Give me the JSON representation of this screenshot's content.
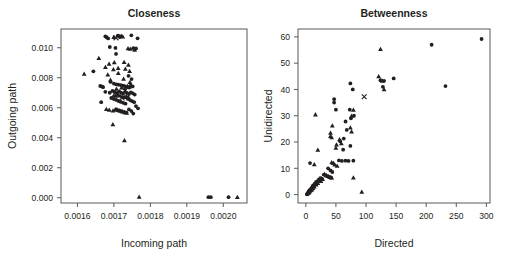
{
  "figure": {
    "background": "#ffffff",
    "ink_color": "#231f20",
    "axis_color": "#58595b"
  },
  "chart_data": [
    {
      "type": "scatter",
      "panel_id": "closeness",
      "title": "Closeness",
      "xlabel": "Incoming path",
      "ylabel": "Outgoing path",
      "xlim": [
        0.001555,
        0.002065
      ],
      "ylim": [
        -0.00035,
        0.01125
      ],
      "xticks": [
        0.0016,
        0.0017,
        0.0018,
        0.0019,
        0.002
      ],
      "xticklabels": [
        "0.0016",
        "0.0017",
        "0.0018",
        "0.0019",
        "0.0020"
      ],
      "yticks": [
        0,
        0.002,
        0.004,
        0.006,
        0.008,
        0.01
      ],
      "yticklabels": [
        "0.000",
        "0.002",
        "0.004",
        "0.006",
        "0.008",
        "0.010"
      ],
      "grid": false,
      "legend": "none",
      "series": [
        {
          "name": "circle-markers",
          "marker": "circle",
          "points": [
            [
              0.0016766,
              0.01076
            ],
            [
              0.0016799,
              0.0107
            ],
            [
              0.0016842,
              0.01062
            ],
            [
              0.0017107,
              0.0108
            ],
            [
              0.0017155,
              0.01077
            ],
            [
              0.0017162,
              0.01071
            ],
            [
              0.0017479,
              0.01083
            ],
            [
              0.0017649,
              0.01063
            ],
            [
              0.0016888,
              0.01005
            ],
            [
              0.0017043,
              0.00999
            ],
            [
              0.0017059,
              0.00959
            ],
            [
              0.0017531,
              0.00997
            ],
            [
              0.0017606,
              0.00995
            ],
            [
              0.0016438,
              0.00843
            ],
            [
              0.0017402,
              0.00813
            ],
            [
              0.0017485,
              0.00791
            ],
            [
              0.0016627,
              0.00745
            ],
            [
              0.0016677,
              0.00741
            ],
            [
              0.0016704,
              0.00737
            ],
            [
              0.0016909,
              0.00772
            ],
            [
              0.0017,
              0.00761
            ],
            [
              0.0017059,
              0.00756
            ],
            [
              0.0017121,
              0.00754
            ],
            [
              0.0017189,
              0.00751
            ],
            [
              0.0017243,
              0.00748
            ],
            [
              0.0017298,
              0.00744
            ],
            [
              0.0017352,
              0.00739
            ],
            [
              0.0017413,
              0.00735
            ],
            [
              0.0017462,
              0.00748
            ],
            [
              0.0017514,
              0.00742
            ],
            [
              0.0016765,
              0.00706
            ],
            [
              0.0016887,
              0.007
            ],
            [
              0.0016962,
              0.00712
            ],
            [
              0.0017022,
              0.00705
            ],
            [
              0.0017081,
              0.00697
            ],
            [
              0.0017143,
              0.00709
            ],
            [
              0.0017196,
              0.00701
            ],
            [
              0.0017251,
              0.00694
            ],
            [
              0.0017306,
              0.00707
            ],
            [
              0.0017358,
              0.00699
            ],
            [
              0.0017412,
              0.00691
            ],
            [
              0.0017466,
              0.00703
            ],
            [
              0.0017519,
              0.00696
            ],
            [
              0.0017571,
              0.00688
            ],
            [
              0.0016652,
              0.00637
            ],
            [
              0.0016928,
              0.00665
            ],
            [
              0.0017,
              0.00658
            ],
            [
              0.0017065,
              0.00652
            ],
            [
              0.0017128,
              0.00645
            ],
            [
              0.0017193,
              0.00639
            ],
            [
              0.0017256,
              0.00633
            ],
            [
              0.0017319,
              0.00627
            ],
            [
              0.0017383,
              0.00659
            ],
            [
              0.0017444,
              0.00651
            ],
            [
              0.0017501,
              0.00644
            ],
            [
              0.0017556,
              0.00637
            ],
            [
              0.0017604,
              0.00611
            ],
            [
              0.0017661,
              0.00596
            ],
            [
              0.0017076,
              0.00589
            ],
            [
              0.0017148,
              0.00582
            ],
            [
              0.0017211,
              0.00577
            ],
            [
              0.0017281,
              0.00572
            ],
            [
              0.0017346,
              0.00568
            ],
            [
              0.0017412,
              0.00589
            ],
            [
              0.0017481,
              0.00578
            ],
            [
              0.0017532,
              0.00561
            ],
            [
              0.0019592,
              4e-05
            ],
            [
              0.0019658,
              4e-05
            ],
            [
              0.0020144,
              4e-05
            ]
          ]
        },
        {
          "name": "triangle-markers",
          "marker": "triangle",
          "points": [
            [
              0.0016996,
              0.01072
            ],
            [
              0.0017213,
              0.01078
            ],
            [
              0.0017243,
              0.01074
            ],
            [
              0.0017387,
              0.00997
            ],
            [
              0.0017449,
              0.00993
            ],
            [
              0.0017568,
              0.00986
            ],
            [
              0.0016587,
              0.00932
            ],
            [
              0.0016868,
              0.00893
            ],
            [
              0.0017011,
              0.00903
            ],
            [
              0.0017281,
              0.00905
            ],
            [
              0.0017398,
              0.00887
            ],
            [
              0.0016768,
              0.00871
            ],
            [
              0.0016987,
              0.00857
            ],
            [
              0.0017117,
              0.00864
            ],
            [
              0.0017314,
              0.00859
            ],
            [
              0.0017431,
              0.00845
            ],
            [
              0.0016185,
              0.00826
            ],
            [
              0.0016833,
              0.00822
            ],
            [
              0.0017121,
              0.00832
            ],
            [
              0.0016906,
              0.00786
            ],
            [
              0.0017266,
              0.00793
            ],
            [
              0.0017441,
              0.00771
            ],
            [
              0.0017069,
              0.00727
            ],
            [
              0.0017211,
              0.00735
            ],
            [
              0.0017303,
              0.00731
            ],
            [
              0.0017376,
              0.00745
            ],
            [
              0.0017425,
              0.0074
            ],
            [
              0.0016998,
              0.00683
            ],
            [
              0.0017055,
              0.00679
            ],
            [
              0.0017113,
              0.00686
            ],
            [
              0.0017167,
              0.00681
            ],
            [
              0.0017225,
              0.00675
            ],
            [
              0.0017281,
              0.00671
            ],
            [
              0.0017339,
              0.00678
            ],
            [
              0.0017395,
              0.00673
            ],
            [
              0.0016794,
              0.00592
            ],
            [
              0.0016873,
              0.00586
            ],
            [
              0.0016976,
              0.00582
            ],
            [
              0.0017037,
              0.00589
            ],
            [
              0.0017101,
              0.00584
            ],
            [
              0.0017162,
              0.00579
            ],
            [
              0.0017224,
              0.00575
            ],
            [
              0.0017289,
              0.0057
            ],
            [
              0.0017351,
              0.00566
            ],
            [
              0.0016972,
              0.00489
            ],
            [
              0.0017289,
              0.00383
            ],
            [
              0.0017693,
              6e-05
            ],
            [
              0.0020385,
              4e-05
            ]
          ]
        },
        {
          "name": "cross-markers",
          "marker": "cross",
          "points": [
            [
              0.0017059,
              0.01066
            ],
            [
              0.0017228,
              0.00665
            ]
          ]
        }
      ]
    },
    {
      "type": "scatter",
      "panel_id": "betweenness",
      "title": "Betweenness",
      "xlabel": "Directed",
      "ylabel": "Unidirected",
      "xlim": [
        -13,
        306
      ],
      "ylim": [
        -3.2,
        63
      ],
      "xticks": [
        0,
        50,
        100,
        150,
        200,
        250,
        300
      ],
      "xticklabels": [
        "0",
        "50",
        "100",
        "150",
        "200",
        "250",
        "300"
      ],
      "yticks": [
        0,
        10,
        20,
        30,
        40,
        50,
        60
      ],
      "yticklabels": [
        "0",
        "10",
        "20",
        "30",
        "40",
        "50",
        "60"
      ],
      "grid": false,
      "legend": "none",
      "series": [
        {
          "name": "circle-markers",
          "marker": "circle",
          "points": [
            [
              292,
              59.2
            ],
            [
              209,
              57.0
            ],
            [
              232,
              41.3
            ],
            [
              146,
              44.2
            ],
            [
              130,
              43.3
            ],
            [
              128,
              41.0
            ],
            [
              124,
              43.5
            ],
            [
              74,
              42.3
            ],
            [
              78,
              40.0
            ],
            [
              73,
              32.3
            ],
            [
              50,
              32.3
            ],
            [
              47,
              36.3
            ],
            [
              47,
              35.0
            ],
            [
              80,
              30.0
            ],
            [
              75,
              29.0
            ],
            [
              66,
              27.8
            ],
            [
              68,
              24.6
            ],
            [
              63,
              21.3
            ],
            [
              57,
              20.3
            ],
            [
              74,
              18.5
            ],
            [
              62,
              17.1
            ],
            [
              55,
              13.0
            ],
            [
              60,
              12.8
            ],
            [
              66,
              12.9
            ],
            [
              71,
              12.8
            ],
            [
              79,
              12.9
            ],
            [
              7,
              12.0
            ],
            [
              37,
              10.0
            ],
            [
              41,
              9.2
            ],
            [
              44,
              8.6
            ],
            [
              30,
              7.6
            ],
            [
              33,
              7.2
            ],
            [
              36,
              6.9
            ],
            [
              39,
              6.6
            ],
            [
              42,
              6.4
            ],
            [
              24,
              6.3
            ],
            [
              27,
              6.0
            ],
            [
              21,
              5.6
            ],
            [
              23,
              5.3
            ],
            [
              17,
              4.8
            ],
            [
              19,
              4.5
            ],
            [
              15,
              4.2
            ],
            [
              16,
              3.9
            ],
            [
              12,
              3.5
            ],
            [
              13,
              3.2
            ],
            [
              11,
              2.9
            ],
            [
              10,
              2.6
            ],
            [
              9,
              2.3
            ],
            [
              8,
              2.0
            ],
            [
              7,
              1.8
            ],
            [
              6,
              1.5
            ],
            [
              5,
              1.3
            ],
            [
              5,
              1.0
            ],
            [
              4,
              0.8
            ],
            [
              4,
              0.6
            ],
            [
              3,
              0.4
            ],
            [
              3,
              0.3
            ],
            [
              2,
              0.2
            ],
            [
              2,
              0.1
            ]
          ]
        },
        {
          "name": "triangle-markers",
          "marker": "triangle",
          "points": [
            [
              124,
              55.4
            ],
            [
              121,
              45.0
            ],
            [
              127,
              43.3
            ],
            [
              130,
              40.1
            ],
            [
              79,
              32.3
            ],
            [
              76,
              30.0
            ],
            [
              16,
              30.5
            ],
            [
              44,
              26.3
            ],
            [
              74,
              25.5
            ],
            [
              76,
              24.0
            ],
            [
              41,
              23.5
            ],
            [
              41,
              22.3
            ],
            [
              43,
              21.8
            ],
            [
              56,
              21.0
            ],
            [
              59,
              19.5
            ],
            [
              51,
              19.0
            ],
            [
              50,
              17.8
            ],
            [
              20,
              17.0
            ],
            [
              43,
              12.3
            ],
            [
              46,
              12.0
            ],
            [
              48,
              11.4
            ],
            [
              52,
              11.0
            ],
            [
              14,
              11.5
            ],
            [
              31,
              7.8
            ],
            [
              34,
              7.4
            ],
            [
              37,
              7.1
            ],
            [
              40,
              6.8
            ],
            [
              43,
              6.5
            ],
            [
              79,
              6.5
            ],
            [
              26,
              6.2
            ],
            [
              28,
              5.9
            ],
            [
              22,
              5.5
            ],
            [
              25,
              5.2
            ],
            [
              18,
              4.7
            ],
            [
              20,
              4.4
            ],
            [
              16,
              4.1
            ],
            [
              17,
              3.8
            ],
            [
              13,
              3.4
            ],
            [
              14,
              3.1
            ],
            [
              11,
              2.8
            ],
            [
              12,
              2.5
            ],
            [
              9,
              2.2
            ],
            [
              10,
              1.9
            ],
            [
              8,
              1.7
            ],
            [
              7,
              1.4
            ],
            [
              6,
              1.2
            ],
            [
              5,
              0.9
            ],
            [
              4,
              0.7
            ],
            [
              3,
              0.5
            ],
            [
              93,
              1.1
            ]
          ]
        },
        {
          "name": "cross-markers",
          "marker": "cross",
          "points": [
            [
              97,
              37.2
            ]
          ]
        }
      ]
    }
  ]
}
